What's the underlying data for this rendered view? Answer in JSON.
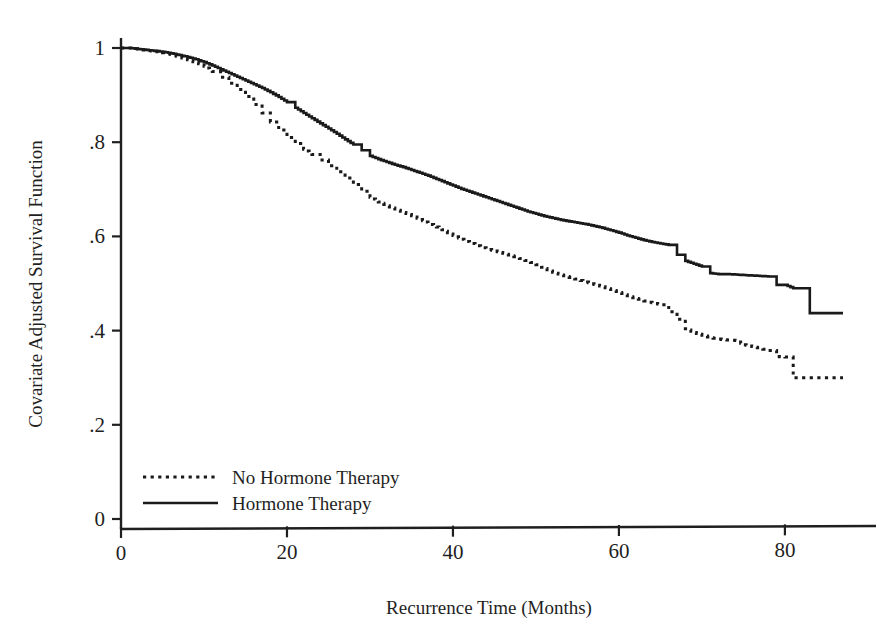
{
  "chart_data": {
    "type": "line",
    "subtype": "kaplan-meier-step",
    "title": "",
    "xlabel": "Recurrence Time (Months)",
    "ylabel": "Covariate Adjusted Survival Function",
    "xlim": [
      0,
      87
    ],
    "ylim": [
      0,
      1
    ],
    "grid": false,
    "legend_position": "lower-left-inside",
    "xticks": [
      0,
      20,
      40,
      60,
      80
    ],
    "xtick_labels": [
      "0",
      "20",
      "40",
      "60",
      "80"
    ],
    "yticks": [
      0,
      0.2,
      0.4,
      0.6,
      0.8,
      1
    ],
    "ytick_labels": [
      "0",
      ".2",
      ".4",
      ".6",
      ".8",
      "1"
    ],
    "series": [
      {
        "name": "Hormone Therapy",
        "style": "solid",
        "color": "#1a1a1a",
        "x": [
          0,
          1,
          2,
          3,
          4,
          5,
          6,
          7,
          8,
          9,
          10,
          11,
          12,
          13,
          14,
          15,
          16,
          17,
          18,
          19,
          20,
          21,
          22,
          23,
          24,
          25,
          26,
          27,
          28,
          29,
          30,
          31,
          32,
          33,
          34,
          35,
          36,
          37,
          38,
          39,
          40,
          41,
          42,
          43,
          44,
          45,
          46,
          47,
          48,
          49,
          50,
          51,
          52,
          53,
          54,
          55,
          56,
          57,
          58,
          59,
          60,
          61,
          62,
          63,
          64,
          65,
          66,
          67,
          68,
          69,
          70,
          71,
          72,
          73,
          74,
          75,
          76,
          77,
          78,
          79,
          80,
          81,
          82,
          83,
          84,
          85,
          86,
          87
        ],
        "y": [
          1.0,
          1.0,
          0.998,
          0.996,
          0.994,
          0.992,
          0.989,
          0.985,
          0.981,
          0.976,
          0.97,
          0.963,
          0.955,
          0.947,
          0.939,
          0.931,
          0.923,
          0.915,
          0.906,
          0.896,
          0.885,
          0.873,
          0.862,
          0.851,
          0.84,
          0.829,
          0.818,
          0.806,
          0.795,
          0.783,
          0.771,
          0.764,
          0.758,
          0.752,
          0.747,
          0.741,
          0.735,
          0.729,
          0.722,
          0.715,
          0.708,
          0.701,
          0.695,
          0.689,
          0.683,
          0.677,
          0.671,
          0.665,
          0.659,
          0.653,
          0.648,
          0.643,
          0.639,
          0.635,
          0.632,
          0.629,
          0.626,
          0.622,
          0.618,
          0.613,
          0.608,
          0.602,
          0.597,
          0.592,
          0.588,
          0.585,
          0.582,
          0.561,
          0.548,
          0.542,
          0.536,
          0.522,
          0.52,
          0.52,
          0.519,
          0.518,
          0.517,
          0.516,
          0.515,
          0.497,
          0.497,
          0.49,
          0.49,
          0.437,
          0.437,
          0.437,
          0.437,
          0.437
        ]
      },
      {
        "name": "No Hormone Therapy",
        "style": "dotted",
        "color": "#1a1a1a",
        "x": [
          0,
          1,
          2,
          3,
          4,
          5,
          6,
          7,
          8,
          9,
          10,
          11,
          12,
          13,
          14,
          15,
          16,
          17,
          18,
          19,
          20,
          21,
          22,
          23,
          24,
          25,
          26,
          27,
          28,
          29,
          30,
          31,
          32,
          33,
          34,
          35,
          36,
          37,
          38,
          39,
          40,
          41,
          42,
          43,
          44,
          45,
          46,
          47,
          48,
          49,
          50,
          51,
          52,
          53,
          54,
          55,
          56,
          57,
          58,
          59,
          60,
          61,
          62,
          63,
          64,
          65,
          66,
          67,
          68,
          69,
          70,
          71,
          72,
          73,
          74,
          75,
          76,
          77,
          78,
          79,
          80,
          81,
          82,
          83,
          84,
          85,
          86,
          87
        ],
        "y": [
          1.0,
          1.0,
          0.998,
          0.995,
          0.993,
          0.99,
          0.986,
          0.981,
          0.975,
          0.969,
          0.961,
          0.95,
          0.938,
          0.925,
          0.912,
          0.897,
          0.88,
          0.862,
          0.843,
          0.826,
          0.81,
          0.797,
          0.785,
          0.774,
          0.762,
          0.75,
          0.737,
          0.724,
          0.71,
          0.696,
          0.683,
          0.673,
          0.665,
          0.658,
          0.651,
          0.644,
          0.636,
          0.628,
          0.62,
          0.611,
          0.602,
          0.594,
          0.587,
          0.58,
          0.574,
          0.569,
          0.564,
          0.559,
          0.553,
          0.547,
          0.54,
          0.532,
          0.524,
          0.518,
          0.513,
          0.508,
          0.503,
          0.498,
          0.493,
          0.487,
          0.481,
          0.474,
          0.468,
          0.463,
          0.459,
          0.455,
          0.44,
          0.424,
          0.404,
          0.396,
          0.39,
          0.385,
          0.382,
          0.38,
          0.379,
          0.37,
          0.366,
          0.362,
          0.358,
          0.345,
          0.344,
          0.3,
          0.3,
          0.3,
          0.3,
          0.3,
          0.3,
          0.3
        ]
      }
    ],
    "annotations": []
  },
  "legend": {
    "entries": [
      {
        "label": "No Hormone Therapy",
        "style": "dotted"
      },
      {
        "label": "Hormone Therapy",
        "style": "solid"
      }
    ]
  },
  "axes": {
    "x_title": "Recurrence Time (Months)",
    "y_title": "Covariate Adjusted Survival Function"
  },
  "colors": {
    "ink": "#1a1a1a",
    "background": "#ffffff"
  }
}
